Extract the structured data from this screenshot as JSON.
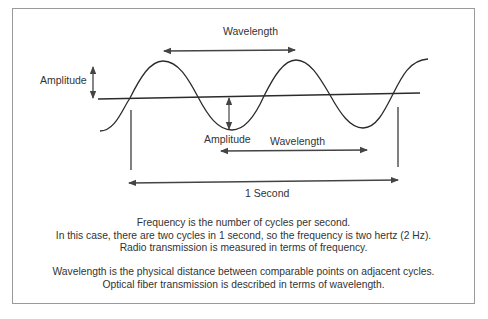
{
  "diagram": {
    "labels": {
      "amplitude_left": "Amplitude",
      "wavelength_top": "Wavelength",
      "amplitude_bottom": "Amplitude",
      "wavelength_bottom": "Wavelength",
      "one_second": "1 Second"
    },
    "colors": {
      "line": "#2b2b2b",
      "arrow": "#444444",
      "frame": "#9a9a9a",
      "text": "#333333"
    }
  },
  "caption": {
    "frequency": [
      "Frequency is the number of cycles per second.",
      "In this case, there are two cycles in 1 second, so the frequency is two hertz (2 Hz).",
      "Radio transmission is measured in terms of frequency."
    ],
    "wavelength": [
      "Wavelength is the physical distance between comparable points on adjacent cycles.",
      "Optical fiber transmission is described in terms of wavelength."
    ]
  }
}
